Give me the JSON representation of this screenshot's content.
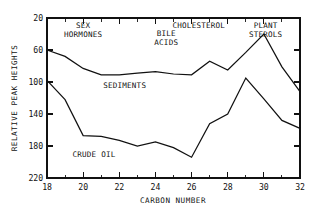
{
  "chart_data": {
    "type": "line",
    "title": "",
    "xlabel": "CARBON NUMBER",
    "ylabel": "RELATIVE PEAK HEIGHTS",
    "xlim": [
      18,
      32
    ],
    "ylim": [
      20,
      220
    ],
    "grid": false,
    "legend": "none (inline annotations)",
    "x_ticks_major": [
      18,
      20,
      22,
      24,
      26,
      28,
      30,
      32
    ],
    "x_ticks_minor": [
      19,
      21,
      23,
      25,
      27,
      29,
      31
    ],
    "y_ticks_major": [
      20,
      60,
      100,
      140,
      180,
      220
    ],
    "x": [
      18,
      19,
      20,
      21,
      22,
      23,
      24,
      25,
      26,
      27,
      28,
      29,
      30,
      31,
      32
    ],
    "series": [
      {
        "name": "SEDIMENTS",
        "values": [
          180,
          172,
          157,
          149,
          149,
          151,
          153,
          150,
          149,
          166,
          155,
          177,
          200,
          159,
          128
        ]
      },
      {
        "name": "CRUDE OIL",
        "values": [
          142,
          118,
          73,
          72,
          67,
          60,
          65,
          58,
          46,
          88,
          100,
          145,
          119,
          92,
          82
        ]
      }
    ],
    "annotations": [
      {
        "text_line1": "SEX",
        "text_line2": "HORMONES",
        "x": 20.0,
        "y": 207
      },
      {
        "text_line1": "CHOLESTEROL",
        "text_line2": "",
        "x": 26.4,
        "y": 207
      },
      {
        "text_line1": "BILE",
        "text_line2": "ACIDS",
        "x": 24.6,
        "y": 198
      },
      {
        "text_line1": "PLANT",
        "text_line2": "STEROLS",
        "x": 30.1,
        "y": 207
      },
      {
        "text_line1": "SEDIMENTS",
        "text_line2": "",
        "x": 22.3,
        "y": 133
      },
      {
        "text_line1": "CRUDE OIL",
        "text_line2": "",
        "x": 20.6,
        "y": 46
      }
    ]
  },
  "y_tick_labels": [
    "220",
    "180",
    "140",
    "100",
    "60",
    "20"
  ],
  "x_tick_labels": [
    "18",
    "20",
    "22",
    "24",
    "26",
    "28",
    "30",
    "32"
  ],
  "labels": {
    "y_axis_title": "RELATIVE PEAK HEIGHTS",
    "x_axis_title": "CARBON NUMBER",
    "sex_hormones_1": "SEX",
    "sex_hormones_2": "HORMONES",
    "cholesterol": "CHOLESTEROL",
    "bile_acids_1": "BILE",
    "bile_acids_2": "ACIDS",
    "plant_sterols_1": "PLANT",
    "plant_sterols_2": "STEROLS",
    "sediments": "SEDIMENTS",
    "crude_oil": "CRUDE OIL"
  },
  "colors": {
    "ink": "#111111",
    "background": "#ffffff"
  }
}
